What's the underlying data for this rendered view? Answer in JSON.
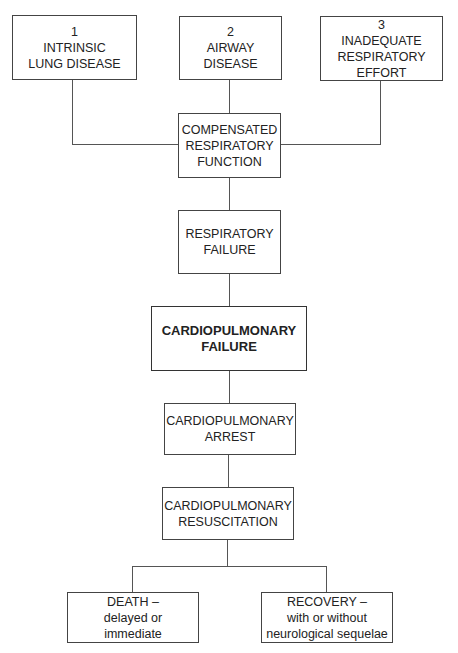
{
  "diagram": {
    "header_cut": "",
    "nodes": {
      "cause_1": {
        "number": "1",
        "line1": "INTRINSIC",
        "line2": "LUNG DISEASE"
      },
      "cause_2": {
        "number": "2",
        "line1": "AIRWAY",
        "line2": "DISEASE"
      },
      "cause_3": {
        "number": "3",
        "line1": "INADEQUATE",
        "line2": "RESPIRATORY",
        "line3": "EFFORT"
      },
      "compensated": {
        "line1": "COMPENSATED",
        "line2": "RESPIRATORY",
        "line3": "FUNCTION"
      },
      "resp_failure": {
        "line1": "RESPIRATORY",
        "line2": "FAILURE"
      },
      "cp_failure": {
        "line1": "CARDIOPULMONARY",
        "line2": "FAILURE"
      },
      "cp_arrest": {
        "line1": "CARDIOPULMONARY",
        "line2": "ARREST"
      },
      "cp_resus": {
        "line1": "CARDIOPULMONARY",
        "line2": "RESUSCITATION"
      },
      "death": {
        "line1": "DEATH –",
        "line2": "delayed or",
        "line3": "immediate"
      },
      "recovery": {
        "line1": "RECOVERY –",
        "line2": "with or without",
        "line3": "neurological sequelae"
      }
    },
    "edges": [
      [
        "cause_1",
        "compensated"
      ],
      [
        "cause_2",
        "compensated"
      ],
      [
        "cause_3",
        "compensated"
      ],
      [
        "compensated",
        "resp_failure"
      ],
      [
        "resp_failure",
        "cp_failure"
      ],
      [
        "cp_failure",
        "cp_arrest"
      ],
      [
        "cp_arrest",
        "cp_resus"
      ],
      [
        "cp_resus",
        "death"
      ],
      [
        "cp_resus",
        "recovery"
      ]
    ],
    "colors": {
      "line": "#555555",
      "border": "#444444",
      "text": "#222222"
    }
  }
}
